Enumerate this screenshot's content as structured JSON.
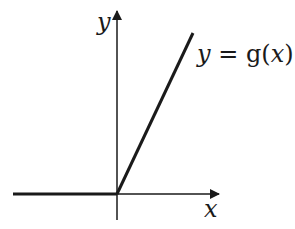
{
  "diagram": {
    "axes": {
      "x_label": "x",
      "y_label": "y"
    },
    "curve": {
      "label_var": "y",
      "label_eq": " = ",
      "label_fn": "g(",
      "label_arg": "x",
      "label_close": ")",
      "description": "g(x) = 0 for x < 0, increasing linearly for x ≥ 0"
    },
    "colors": {
      "ink": "#1a1a1a",
      "background": "#ffffff"
    }
  }
}
